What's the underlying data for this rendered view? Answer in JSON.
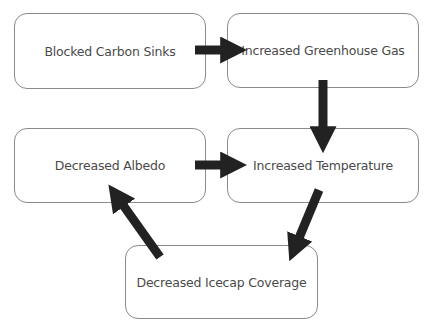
{
  "diagram": {
    "type": "flowchart",
    "nodes": [
      {
        "id": "blocked-carbon-sinks",
        "label": "Blocked Carbon Sinks"
      },
      {
        "id": "increased-greenhouse-gas",
        "label": "Increased Greenhouse Gas"
      },
      {
        "id": "decreased-albedo",
        "label": "Decreased Albedo"
      },
      {
        "id": "increased-temperature",
        "label": "Increased Temperature"
      },
      {
        "id": "decreased-icecap-coverage",
        "label": "Decreased Icecap Coverage"
      }
    ],
    "edges": [
      {
        "from": "blocked-carbon-sinks",
        "to": "increased-greenhouse-gas"
      },
      {
        "from": "increased-greenhouse-gas",
        "to": "increased-temperature"
      },
      {
        "from": "decreased-albedo",
        "to": "increased-temperature"
      },
      {
        "from": "increased-temperature",
        "to": "decreased-icecap-coverage"
      },
      {
        "from": "decreased-icecap-coverage",
        "to": "decreased-albedo"
      }
    ],
    "colors": {
      "border": "#8a8a8a",
      "text": "#4a4a4a",
      "arrow": "#222222"
    }
  }
}
